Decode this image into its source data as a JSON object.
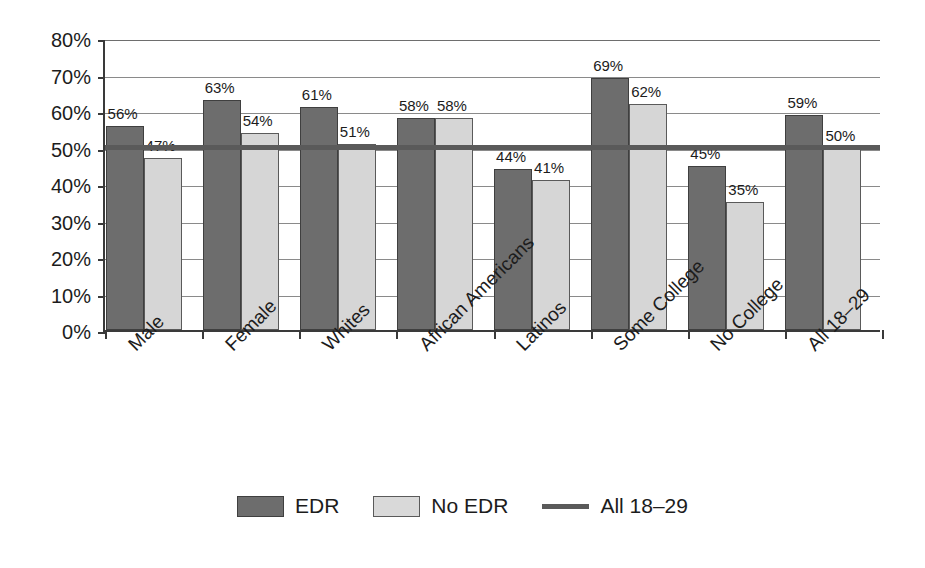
{
  "chart_data": {
    "type": "bar",
    "title": "",
    "subtitle": "",
    "xlabel": "",
    "ylabel": "",
    "ylim": [
      0,
      80
    ],
    "ytick_labels": [
      "0%",
      "10%",
      "20%",
      "30%",
      "40%",
      "50%",
      "60%",
      "70%",
      "80%"
    ],
    "ytick_values": [
      0,
      10,
      20,
      30,
      40,
      50,
      60,
      70,
      80
    ],
    "grid": true,
    "legend_position": "bottom-center",
    "categories": [
      "Male",
      "Female",
      "Whites",
      "African Americans",
      "Latinos",
      "Some College",
      "No College",
      "All 18–29"
    ],
    "series": [
      {
        "name": "EDR",
        "color": "#6d6d6d",
        "values": [
          56,
          63,
          61,
          58,
          44,
          69,
          45,
          59
        ],
        "labels": [
          "56%",
          "63%",
          "61%",
          "58%",
          "44%",
          "69%",
          "45%",
          "59%"
        ]
      },
      {
        "name": "No EDR",
        "color": "#d6d6d6",
        "values": [
          47,
          54,
          51,
          58,
          41,
          62,
          35,
          50
        ],
        "labels": [
          "47%",
          "54%",
          "51%",
          "58%",
          "41%",
          "62%",
          "35%",
          "50%"
        ]
      }
    ],
    "reference_line": {
      "name": "All 18–29",
      "value": 50,
      "color": "#5a5a5a"
    }
  },
  "legend": {
    "items": [
      {
        "label": "EDR",
        "marker": "dark-square-swatch"
      },
      {
        "label": "No EDR",
        "marker": "light-square-swatch"
      },
      {
        "label": "All 18–29",
        "marker": "horizontal-line"
      }
    ]
  },
  "colors": {
    "edr_bar": "#6d6d6d",
    "no_edr_bar": "#d6d6d6",
    "reference_line": "#5a5a5a",
    "axis": "#3a3a3a",
    "gridline": "#8a8a8a",
    "text": "#1c1c1c",
    "background": "#ffffff"
  }
}
